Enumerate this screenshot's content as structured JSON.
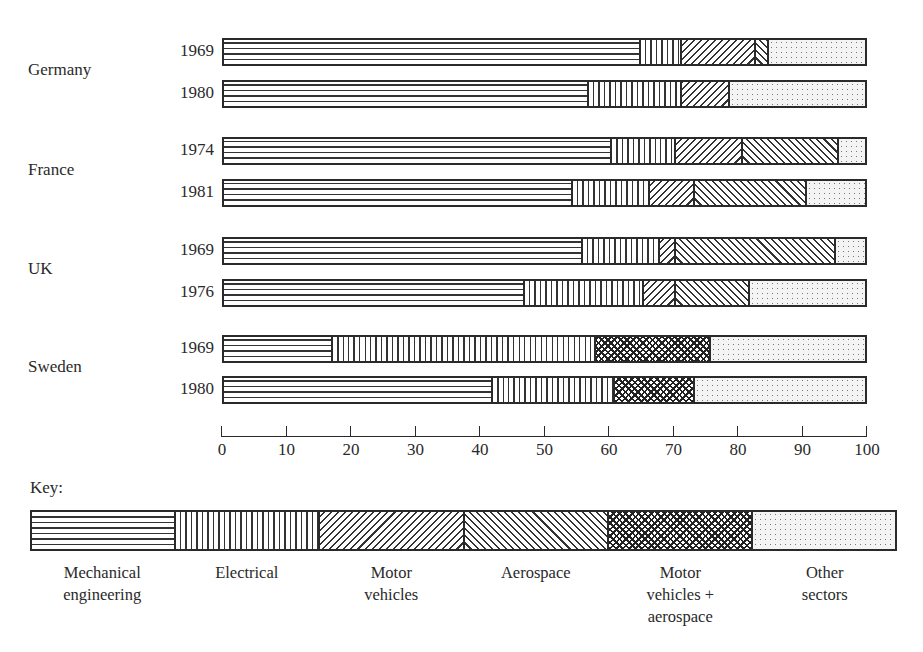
{
  "chart_data": {
    "type": "bar",
    "orientation": "horizontal",
    "stacked": true,
    "title": "",
    "xlabel": "",
    "ylabel": "",
    "xlim": [
      0,
      100
    ],
    "x_ticks": [
      0,
      10,
      20,
      30,
      40,
      50,
      60,
      70,
      80,
      90,
      100
    ],
    "legend_title": "Key:",
    "legend_position": "bottom",
    "sectors": [
      {
        "key": "mech",
        "name": "Mechanical engineering",
        "label": "Mechanical\nengineering"
      },
      {
        "key": "elec",
        "name": "Electrical",
        "label": "Electrical"
      },
      {
        "key": "motor",
        "name": "Motor vehicles",
        "label": "Motor\nvehicles"
      },
      {
        "key": "aero",
        "name": "Aerospace",
        "label": "Aerospace"
      },
      {
        "key": "mvaero",
        "name": "Motor vehicles + aerospace",
        "label": "Motor\nvehicles +\naerospace"
      },
      {
        "key": "other",
        "name": "Other sectors",
        "label": "Other\nsectors"
      }
    ],
    "groups": [
      {
        "country": "Germany",
        "bars": [
          {
            "year": "1969",
            "segments": [
              {
                "sector": "mech",
                "value": 65
              },
              {
                "sector": "elec",
                "value": 6.5
              },
              {
                "sector": "motor",
                "value": 11.5
              },
              {
                "sector": "aero",
                "value": 2
              },
              {
                "sector": "other",
                "value": 15
              }
            ]
          },
          {
            "year": "1980",
            "segments": [
              {
                "sector": "mech",
                "value": 57
              },
              {
                "sector": "elec",
                "value": 14.5
              },
              {
                "sector": "motor",
                "value": 7.5
              },
              {
                "sector": "other",
                "value": 21
              }
            ]
          }
        ]
      },
      {
        "country": "France",
        "bars": [
          {
            "year": "1974",
            "segments": [
              {
                "sector": "mech",
                "value": 60.5
              },
              {
                "sector": "elec",
                "value": 10
              },
              {
                "sector": "motor",
                "value": 10.5
              },
              {
                "sector": "aero",
                "value": 15
              },
              {
                "sector": "other",
                "value": 4
              }
            ]
          },
          {
            "year": "1981",
            "segments": [
              {
                "sector": "mech",
                "value": 54.5
              },
              {
                "sector": "elec",
                "value": 12
              },
              {
                "sector": "motor",
                "value": 7
              },
              {
                "sector": "aero",
                "value": 17.5
              },
              {
                "sector": "other",
                "value": 9
              }
            ]
          }
        ]
      },
      {
        "country": "UK",
        "bars": [
          {
            "year": "1969",
            "segments": [
              {
                "sector": "mech",
                "value": 56
              },
              {
                "sector": "elec",
                "value": 12
              },
              {
                "sector": "motor",
                "value": 2.5
              },
              {
                "sector": "aero",
                "value": 25
              },
              {
                "sector": "other",
                "value": 4.5
              }
            ]
          },
          {
            "year": "1976",
            "segments": [
              {
                "sector": "mech",
                "value": 47
              },
              {
                "sector": "elec",
                "value": 18.5
              },
              {
                "sector": "motor",
                "value": 5
              },
              {
                "sector": "aero",
                "value": 11.5
              },
              {
                "sector": "other",
                "value": 18
              }
            ]
          }
        ]
      },
      {
        "country": "Sweden",
        "bars": [
          {
            "year": "1969",
            "segments": [
              {
                "sector": "mech",
                "value": 17
              },
              {
                "sector": "elec",
                "value": 41
              },
              {
                "sector": "mvaero",
                "value": 18
              },
              {
                "sector": "other",
                "value": 24
              }
            ]
          },
          {
            "year": "1980",
            "segments": [
              {
                "sector": "mech",
                "value": 42
              },
              {
                "sector": "elec",
                "value": 19
              },
              {
                "sector": "mvaero",
                "value": 12.5
              },
              {
                "sector": "other",
                "value": 26.5
              }
            ]
          }
        ]
      }
    ]
  }
}
